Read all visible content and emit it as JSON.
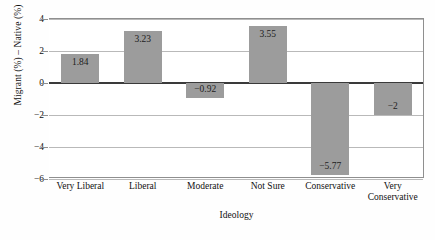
{
  "chart_data": {
    "type": "bar",
    "title": "",
    "xlabel": "Ideology",
    "ylabel": "Migrant (%) – Native (%)",
    "categories": [
      "Very Liberal",
      "Liberal",
      "Moderate",
      "Not Sure",
      "Conservative",
      "Very Conservative"
    ],
    "values": [
      1.84,
      3.23,
      -0.92,
      3.55,
      -5.77,
      -2
    ],
    "value_labels": [
      "1.84",
      "3.23",
      "-0.92",
      "3.55",
      "-5.77",
      "-2"
    ],
    "ylim": [
      -6,
      4
    ],
    "yticks": [
      4,
      2,
      0,
      -2,
      -4,
      -6
    ],
    "ytick_labels": [
      "4",
      "2",
      "0",
      "-2",
      "-4",
      "-6"
    ],
    "grid": true,
    "legend": "none",
    "bar_color": "#9c9c9c",
    "gridline_color": "#b9b9b9",
    "zeroline_color": "#3a3a3a",
    "axis_color": "#8f8f8f",
    "background_color": "#ffffff"
  }
}
